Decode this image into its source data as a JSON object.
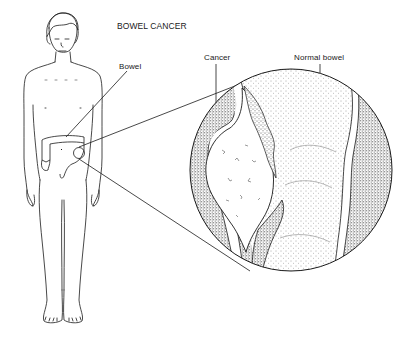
{
  "diagram": {
    "title": "BOWEL CANCER",
    "labels": {
      "bowel": "Bowel",
      "cancer": "Cancer",
      "normal_bowel": "Normal bowel"
    },
    "figure": {
      "subject": "full-body human figure with colon highlighted",
      "magnified_view": "circular inset showing cross-section of bowel with tumour"
    },
    "colors": {
      "ink": "#1a1a1a",
      "background": "#ffffff",
      "stipple_dark": "#7a7a7a",
      "stipple_light": "#c9c9c9"
    }
  }
}
